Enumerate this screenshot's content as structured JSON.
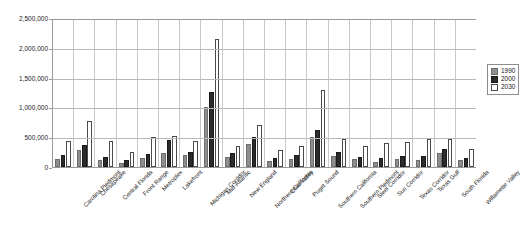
{
  "chart_data": {
    "type": "bar",
    "title": "",
    "xlabel": "",
    "ylabel": "",
    "ylim": [
      0,
      2500000
    ],
    "ytick_step": 500000,
    "ytick_labels": [
      "0",
      "500,000",
      "1,000,000",
      "1,500,000",
      "2,000,000",
      "2,500,000"
    ],
    "ytick_values": [
      0,
      500000,
      1000000,
      1500000,
      2000000,
      2500000
    ],
    "grid": true,
    "legend_position": "right",
    "categories": [
      "Carolina Piedmont",
      "Chesapeake",
      "Central Florida",
      "Front Range",
      "Metroplex",
      "Lakefront",
      "Michigan Corridor",
      "Mid-Atlantic",
      "New England",
      "Northern California",
      "Ohio Valley",
      "Puget Sound",
      "Southern California",
      "Southern Piedmont",
      "Steel Corridor",
      "Sun Corridor",
      "Texas Corridor",
      "Texas Gulf",
      "South Florida",
      "Willamette Valley"
    ],
    "series": [
      {
        "name": "1990",
        "color": "#8e8e8e",
        "values": [
          130000,
          285000,
          110000,
          65000,
          150000,
          230000,
          200000,
          1000000,
          175000,
          390000,
          100000,
          130000,
          510000,
          185000,
          130000,
          85000,
          130000,
          115000,
          235000,
          110000
        ]
      },
      {
        "name": "2000",
        "color": "#2b2b2b",
        "values": [
          200000,
          375000,
          165000,
          115000,
          225000,
          450000,
          255000,
          1260000,
          230000,
          500000,
          145000,
          200000,
          620000,
          250000,
          160000,
          150000,
          190000,
          185000,
          300000,
          150000
        ]
      },
      {
        "name": "2030",
        "color": "#ffffff",
        "values": [
          440000,
          775000,
          440000,
          245000,
          505000,
          525000,
          430000,
          2150000,
          360000,
          700000,
          280000,
          355000,
          1300000,
          475000,
          345000,
          395000,
          420000,
          470000,
          475000,
          300000
        ]
      }
    ]
  },
  "legend": {
    "entries": [
      {
        "label": "1990",
        "series": "s1990"
      },
      {
        "label": "2000",
        "series": "s2000"
      },
      {
        "label": "2030",
        "series": "s2030"
      }
    ]
  }
}
